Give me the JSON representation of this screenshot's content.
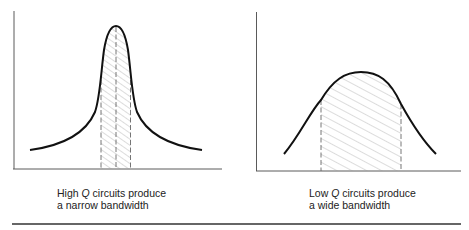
{
  "figure": {
    "left_panel": {
      "caption_line1_pre": "High ",
      "caption_q": "Q",
      "caption_line1_post": " circuits produce",
      "caption_line2": "a narrow bandwidth",
      "curve": "narrow resonance peak",
      "shaded_band": "narrow bandwidth"
    },
    "right_panel": {
      "caption_line1_pre": "Low ",
      "caption_q": "Q",
      "caption_line1_post": " circuits produce",
      "caption_line2": "a wide bandwidth",
      "curve": "broad resonance peak",
      "shaded_band": "wide bandwidth"
    }
  },
  "colors": {
    "curve": "#111111",
    "axis": "#555555",
    "hatch": "#999999",
    "rule": "#333333"
  }
}
